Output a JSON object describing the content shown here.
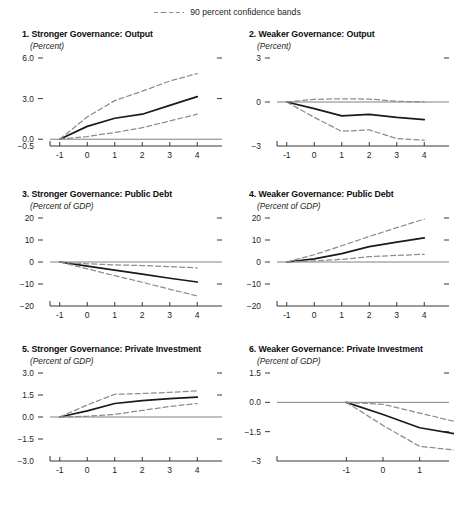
{
  "legend": {
    "label": "90 percent confidence bands",
    "line_style": "dashed",
    "line_color": "#8c8c8c"
  },
  "style": {
    "central_line_color": "#1a1a1a",
    "band_color": "#8c8c8c",
    "zero_line_color": "#808080",
    "axis_color": "#231f20",
    "background": "#ffffff"
  },
  "chart_data": [
    {
      "type": "line",
      "panel_number": "1",
      "title": "1. Stronger Governance: Output",
      "subtitle": "(Percent)",
      "xlabel": "",
      "ylabel": "",
      "x": [
        -1,
        0,
        1,
        2,
        3,
        4
      ],
      "xticks": [
        "-1",
        "0",
        "1",
        "2",
        "3",
        "4"
      ],
      "xlim": [
        -1.5,
        4.5
      ],
      "ylim": [
        -0.5,
        6.0
      ],
      "yticks": [
        6.0,
        3.0,
        0.0,
        -0.5
      ],
      "ytick_labels": [
        "6.0",
        "3.0",
        "0.0",
        "−0.5"
      ],
      "right_ticks": [
        6.0,
        3.0
      ],
      "grid": false,
      "zero_line": true,
      "series": [
        {
          "name": "Central estimate",
          "style": "solid",
          "values": [
            0.0,
            0.95,
            1.55,
            1.85,
            2.5,
            3.15
          ]
        },
        {
          "name": "Upper 90 percent confidence band",
          "style": "dashed",
          "values": [
            0.0,
            1.65,
            2.85,
            3.55,
            4.3,
            4.85
          ]
        },
        {
          "name": "Lower 90 percent confidence band",
          "style": "dashed",
          "values": [
            0.0,
            0.2,
            0.5,
            0.85,
            1.35,
            1.85
          ]
        }
      ]
    },
    {
      "type": "line",
      "panel_number": "2",
      "title": "2. Weaker Governance: Output",
      "subtitle": "(Percent)",
      "xlabel": "",
      "ylabel": "",
      "x": [
        -1,
        0,
        1,
        2,
        3,
        4
      ],
      "xticks": [
        "-1",
        "0",
        "1",
        "2",
        "3",
        "4"
      ],
      "xlim": [
        -1.5,
        4.5
      ],
      "ylim": [
        -3,
        3
      ],
      "yticks": [
        3,
        0,
        -3
      ],
      "ytick_labels": [
        "3",
        "0",
        "−3"
      ],
      "right_ticks": [
        3
      ],
      "grid": false,
      "zero_line": true,
      "series": [
        {
          "name": "Central estimate",
          "style": "solid",
          "values": [
            0.0,
            -0.45,
            -0.95,
            -0.85,
            -1.05,
            -1.2
          ]
        },
        {
          "name": "Upper 90 percent confidence band",
          "style": "dashed",
          "values": [
            0.0,
            0.18,
            0.22,
            0.2,
            0.05,
            0.0
          ]
        },
        {
          "name": "Lower 90 percent confidence band",
          "style": "dashed",
          "values": [
            0.0,
            -1.05,
            -2.0,
            -1.9,
            -2.5,
            -2.6
          ]
        }
      ]
    },
    {
      "type": "line",
      "panel_number": "3",
      "title": "3. Stronger Governance: Public Debt",
      "subtitle": "(Percent of GDP)",
      "xlabel": "",
      "ylabel": "",
      "x": [
        -1,
        0,
        1,
        2,
        3,
        4
      ],
      "xticks": [
        "-1",
        "0",
        "1",
        "2",
        "3",
        "4"
      ],
      "xlim": [
        -1.5,
        4.5
      ],
      "ylim": [
        -20,
        20
      ],
      "yticks": [
        20,
        10,
        0,
        -10,
        -20
      ],
      "ytick_labels": [
        "20",
        "10",
        "0",
        "−10",
        "−20"
      ],
      "right_ticks": [
        20,
        10,
        -10
      ],
      "grid": false,
      "zero_line": true,
      "series": [
        {
          "name": "Central estimate",
          "style": "solid",
          "values": [
            0.0,
            -1.9,
            -3.7,
            -5.5,
            -7.4,
            -9.1
          ]
        },
        {
          "name": "Upper 90 percent confidence band",
          "style": "dashed",
          "values": [
            0.0,
            -0.8,
            -1.3,
            -1.6,
            -2.1,
            -2.7
          ]
        },
        {
          "name": "Lower 90 percent confidence band",
          "style": "dashed",
          "values": [
            0.0,
            -3.1,
            -6.2,
            -9.2,
            -12.4,
            -15.4
          ]
        }
      ]
    },
    {
      "type": "line",
      "panel_number": "4",
      "title": "4. Weaker Governance: Public Debt",
      "subtitle": "(Percent of GDP)",
      "xlabel": "",
      "ylabel": "",
      "x": [
        -1,
        0,
        1,
        2,
        3,
        4
      ],
      "xticks": [
        "-1",
        "0",
        "1",
        "2",
        "3",
        "4"
      ],
      "xlim": [
        -1.5,
        4.5
      ],
      "ylim": [
        -20,
        20
      ],
      "yticks": [
        20,
        10,
        0,
        -10,
        -20
      ],
      "ytick_labels": [
        "20",
        "10",
        "0",
        "−10",
        "−20"
      ],
      "right_ticks": [
        20,
        10,
        -10
      ],
      "grid": false,
      "zero_line": true,
      "series": [
        {
          "name": "Central estimate",
          "style": "solid",
          "values": [
            0.0,
            1.4,
            3.8,
            7.0,
            9.0,
            11.0
          ]
        },
        {
          "name": "Upper 90 percent confidence band",
          "style": "dashed",
          "values": [
            0.0,
            3.3,
            7.4,
            11.6,
            15.6,
            19.5
          ]
        },
        {
          "name": "Lower 90 percent confidence band",
          "style": "dashed",
          "values": [
            0.0,
            0.5,
            1.2,
            2.4,
            3.0,
            3.5
          ]
        }
      ]
    },
    {
      "type": "line",
      "panel_number": "5",
      "title": "5. Stronger Governance: Private Investment",
      "subtitle": "(Percent of GDP)",
      "xlabel": "",
      "ylabel": "",
      "x": [
        -1,
        0,
        1,
        2,
        3,
        4
      ],
      "xticks": [
        "-1",
        "0",
        "1",
        "2",
        "3",
        "4"
      ],
      "xlim": [
        -1.5,
        4.5
      ],
      "ylim": [
        -3.0,
        3.0
      ],
      "yticks": [
        3.0,
        1.5,
        0.0,
        -1.5,
        -3.0
      ],
      "ytick_labels": [
        "3.0",
        "1.5",
        "0.0",
        "−1.5",
        "−3.0"
      ],
      "right_ticks": [
        3.0,
        1.5,
        -1.5
      ],
      "grid": false,
      "zero_line": true,
      "series": [
        {
          "name": "Central estimate",
          "style": "solid",
          "values": [
            0.0,
            0.42,
            0.92,
            1.12,
            1.25,
            1.35
          ]
        },
        {
          "name": "Upper 90 percent confidence band",
          "style": "dashed",
          "values": [
            0.0,
            0.82,
            1.55,
            1.6,
            1.68,
            1.78
          ]
        },
        {
          "name": "Lower 90 percent confidence band",
          "style": "dashed",
          "values": [
            0.0,
            0.05,
            0.18,
            0.45,
            0.72,
            0.92
          ]
        }
      ]
    },
    {
      "type": "line",
      "panel_number": "6",
      "title": "6. Weaker Governance: Private Investment",
      "subtitle": "(Percent of GDP)",
      "xlabel": "",
      "ylabel": "",
      "x": [
        -1,
        0,
        1,
        2,
        3,
        4
      ],
      "xticks": [
        "-1",
        "0",
        "1",
        "2",
        "3",
        "4"
      ],
      "xlim": [
        -3.0,
        1.5
      ],
      "ylim": [
        -3.0,
        1.5
      ],
      "yticks": [
        1.5,
        0.0,
        -1.5,
        -3.0
      ],
      "ytick_labels": [
        "1.5",
        "0.0",
        "−1.5",
        "−3"
      ],
      "right_ticks": [
        1.5,
        -1.5
      ],
      "grid": false,
      "zero_line": true,
      "series": [
        {
          "name": "Central estimate",
          "style": "solid",
          "values": [
            0.0,
            -0.62,
            -1.3,
            -1.62,
            -1.82,
            -1.95
          ]
        },
        {
          "name": "Upper 90 percent confidence band",
          "style": "dashed",
          "values": [
            0.0,
            -0.1,
            -0.55,
            -1.0,
            -1.3,
            -1.42
          ]
        },
        {
          "name": "Lower 90 percent confidence band",
          "style": "dashed",
          "values": [
            0.0,
            -1.18,
            -2.25,
            -2.45,
            -2.62,
            -2.88
          ]
        }
      ]
    }
  ]
}
